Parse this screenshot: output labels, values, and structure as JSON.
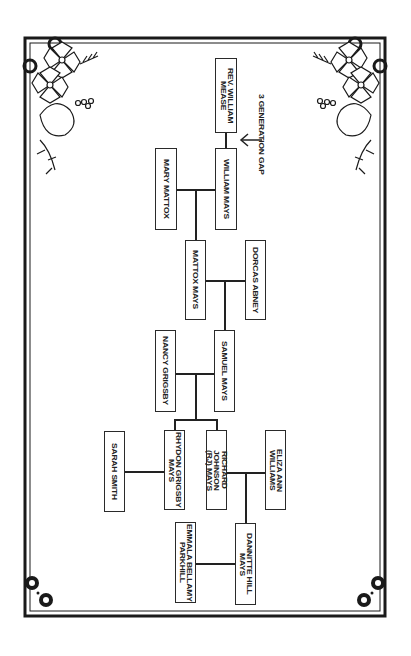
{
  "diagram": {
    "type": "family-tree",
    "orientation": "rotated-90-clockwise",
    "annotation": {
      "label": "3 GENERATION GAP",
      "icon": "arrow-left-icon"
    },
    "people": [
      {
        "id": "rev_william_mease",
        "label": "REV. WILLIAM\nMEASE"
      },
      {
        "id": "william_mays",
        "label": "WILLIAM MAYS"
      },
      {
        "id": "mary_mattox",
        "label": "MARY MATTOX"
      },
      {
        "id": "mattox_mays",
        "label": "MATTOX MAYS"
      },
      {
        "id": "dorcas_abney",
        "label": "DORCAS ABNEY"
      },
      {
        "id": "samuel_mays",
        "label": "SAMUEL MAYS"
      },
      {
        "id": "nancy_grigsby",
        "label": "NANCY GRIGSBY"
      },
      {
        "id": "rhydon_grigsby_mays",
        "label": "RHYDON GRIGSBY\nMAYS"
      },
      {
        "id": "richard_johnson_mays",
        "label": "RICHARD JOHNSON\n(RJ) MAYS"
      },
      {
        "id": "eliza_ann_williams",
        "label": "ELIZA ANN\nWILLIAMS"
      },
      {
        "id": "sarah_smith",
        "label": "SARAH SMITH"
      },
      {
        "id": "dannitte_hill_mays",
        "label": "DANNITTE HILL\nMAYS"
      },
      {
        "id": "emmala_bellamy_parkhill",
        "label": "EMMALA BELLAMY\nPARKHILL"
      }
    ],
    "relations": [
      {
        "type": "ancestor-gap",
        "from": "rev_william_mease",
        "to": "william_mays",
        "note": "3 GENERATION GAP"
      },
      {
        "type": "couple",
        "a": "william_mays",
        "b": "mary_mattox",
        "children": [
          "mattox_mays"
        ]
      },
      {
        "type": "couple",
        "a": "mattox_mays",
        "b": "dorcas_abney",
        "children": [
          "samuel_mays"
        ]
      },
      {
        "type": "couple",
        "a": "samuel_mays",
        "b": "nancy_grigsby",
        "children": [
          "rhydon_grigsby_mays",
          "richard_johnson_mays"
        ]
      },
      {
        "type": "couple",
        "a": "rhydon_grigsby_mays",
        "b": "sarah_smith",
        "children": []
      },
      {
        "type": "couple",
        "a": "richard_johnson_mays",
        "b": "eliza_ann_williams",
        "children": [
          "dannitte_hill_mays"
        ]
      },
      {
        "type": "couple",
        "a": "dannitte_hill_mays",
        "b": "emmala_bellamy_parkhill",
        "children": []
      }
    ],
    "colors": {
      "ink": "#222222",
      "background": "#ffffff"
    }
  }
}
